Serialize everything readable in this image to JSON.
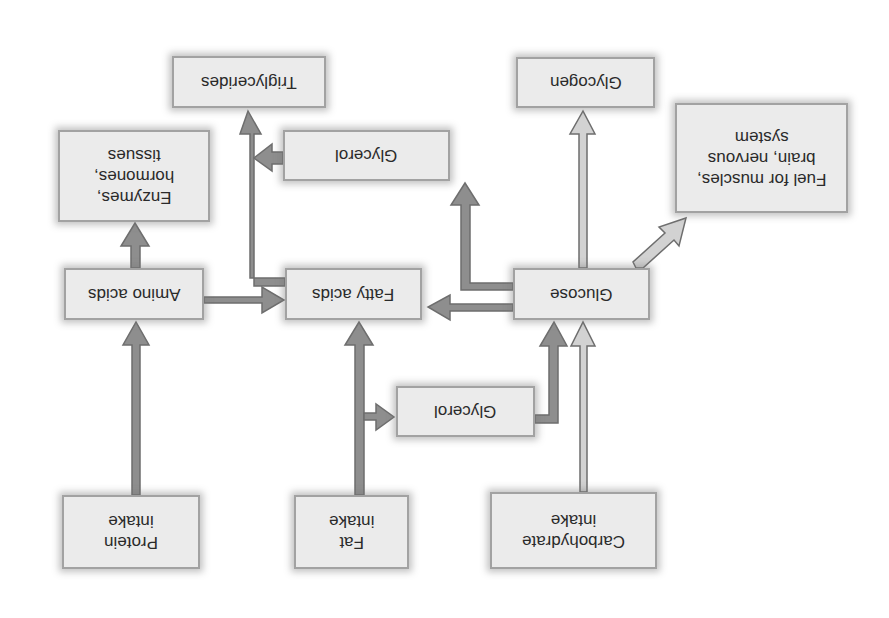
{
  "diagram": {
    "orientation": "rotated 180 degrees (upside-down)",
    "colors": {
      "box_fill": "#ebebeb",
      "box_border": "#a2a2a2",
      "arrow_dark": "#8e8e8e",
      "arrow_light": "#d2d2d2",
      "arrow_outline": "#6e6e6e",
      "text": "#2a2a2a"
    },
    "nodes": {
      "triglycerides": "Triglycerides",
      "glycogen": "Glycogen",
      "enzymes": "Enzymes,\nhormones,\ntissues",
      "glycerol_top": "Glycerol",
      "fuel": "Fuel for muscles,\nbrain, nervous\nsystem",
      "amino_acids": "Amino acids",
      "fatty_acids": "Fatty acids",
      "glucose": "Glucose",
      "glycerol_mid": "Glycerol",
      "protein_intake": "Protein\nintake",
      "fat_intake": "Fat\nintake",
      "carbohydrate_intake": "Carbohydrate\nintake"
    },
    "edges": [
      {
        "from": "Protein intake",
        "to": "Amino acids"
      },
      {
        "from": "Amino acids",
        "to": "Enzymes, hormones, tissues"
      },
      {
        "from": "Amino acids",
        "to": "Fatty acids"
      },
      {
        "from": "Fat intake",
        "to": "Fatty acids"
      },
      {
        "from": "Fat intake",
        "to": "Glycerol"
      },
      {
        "from": "Glycerol",
        "to": "Glucose"
      },
      {
        "from": "Carbohydrate intake",
        "to": "Glucose"
      },
      {
        "from": "Glucose",
        "to": "Fatty acids"
      },
      {
        "from": "Glucose",
        "to": "Glycerol"
      },
      {
        "from": "Glucose",
        "to": "Glycogen"
      },
      {
        "from": "Glucose",
        "to": "Fuel for muscles, brain, nervous system"
      },
      {
        "from": "Fatty acids",
        "to": "Triglycerides"
      },
      {
        "from": "Glycerol",
        "to": "Triglycerides"
      }
    ]
  }
}
